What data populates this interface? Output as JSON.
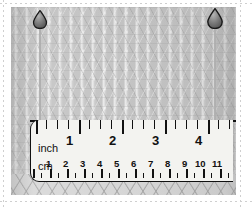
{
  "figure": {
    "colors": {
      "fabric": "#c3c3c3",
      "fabric_highlight": "#ffffff",
      "band": "#d6d6d6",
      "pin_head": "#6e6e6e",
      "pin_head_outline": "#1a1a1a",
      "pin_shaft": "#9a9a9a",
      "ruler_body": "#f3f3f0",
      "ruler_ink": "#111111",
      "page_background": "#ffffff",
      "guide_line": "#cfcfcf"
    }
  },
  "pins": [
    {
      "name": "left-marker-pin",
      "x": 32,
      "y": 10,
      "head_w": 15,
      "head_h": 19,
      "shaft_len": 108
    },
    {
      "name": "right-marker-pin",
      "x": 206,
      "y": 8,
      "head_w": 17,
      "head_h": 21,
      "shaft_len": 112
    }
  ],
  "ruler": {
    "inch_scale": {
      "unit_label": "inch",
      "labels": [
        "1",
        "2",
        "3",
        "4"
      ],
      "label_positions_px": [
        75,
        118,
        161,
        204
      ],
      "major_ticks_px": [
        36,
        79,
        122,
        165,
        208
      ],
      "minor_ticks_px": [
        46,
        57,
        68,
        89,
        100,
        111,
        132,
        143,
        154,
        175,
        186,
        197,
        218,
        229
      ],
      "tick_spacing_in_px": 43
    },
    "cm_scale": {
      "unit_label": "cm",
      "labels": [
        "1",
        "2",
        "3",
        "4",
        "5",
        "6",
        "7",
        "8",
        "9",
        "10",
        "11"
      ],
      "label_positions_px": [
        50,
        67,
        84,
        101,
        118,
        135,
        152,
        169,
        186,
        203,
        220
      ],
      "major_ticks_px": [
        33,
        50,
        67,
        84,
        101,
        118,
        135,
        152,
        169,
        186,
        203,
        220
      ],
      "minor_ticks_px": [
        41,
        58,
        75,
        92,
        109,
        126,
        143,
        160,
        177,
        194,
        211,
        228
      ],
      "tick_spacing_cm_px": 17
    }
  }
}
